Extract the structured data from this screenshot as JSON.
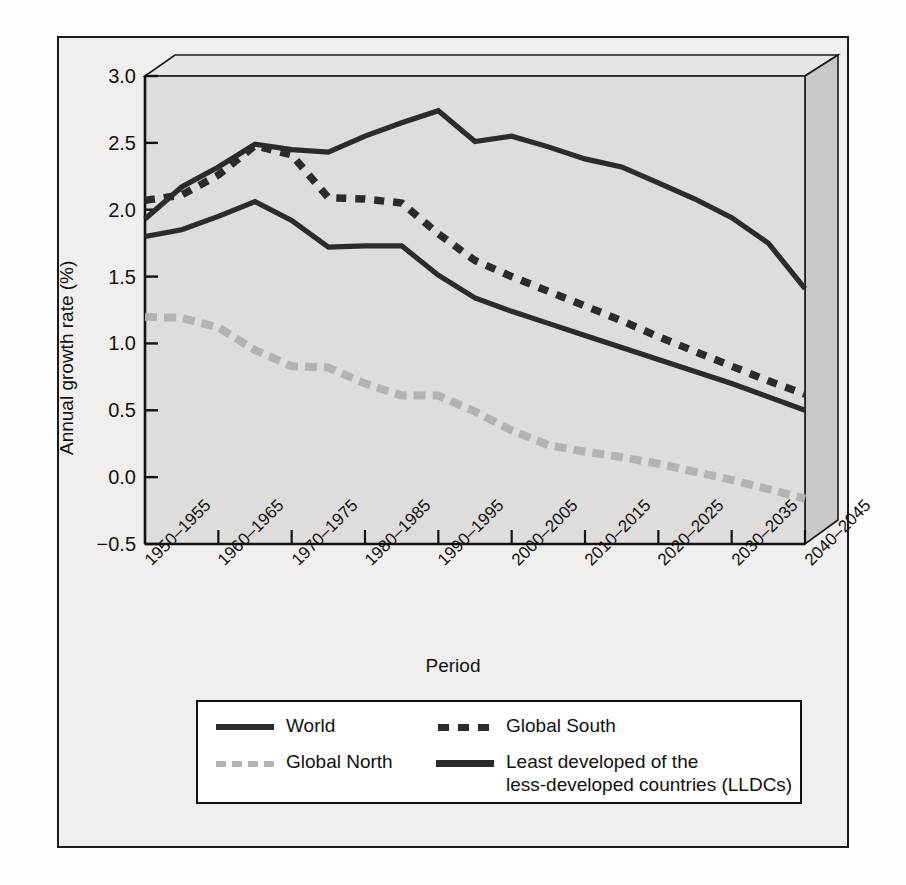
{
  "credit": "United Nations",
  "axes": {
    "ylabel": "Annual growth rate (%)",
    "xlabel": "Period",
    "yticks": [
      "3.0",
      "2.5",
      "2.0",
      "1.5",
      "1.0",
      "0.5",
      "0.0",
      "−0.5"
    ],
    "xticks": [
      "1950–1955",
      "1960–1965",
      "1970–1975",
      "1980–1985",
      "1990–1995",
      "2000–2005",
      "2010–2015",
      "2020–2025",
      "2030–2035",
      "2040–2045"
    ]
  },
  "legend": {
    "items": [
      {
        "label": "World",
        "style": "solid-thick",
        "color": "#2b2b2b"
      },
      {
        "label": "Global South",
        "style": "dashed-dark",
        "color": "#2b2b2b"
      },
      {
        "label": "Global North",
        "style": "dashed-light",
        "color": "#b3b3b3"
      },
      {
        "label_line1": "Least developed of the",
        "label_line2": "less-developed countries (LLDCs)",
        "style": "solid-thick",
        "color": "#2b2b2b"
      }
    ]
  },
  "chart_data": {
    "type": "line",
    "title": "",
    "xlabel": "Period",
    "ylabel": "Annual growth rate (%)",
    "ylim": [
      -0.5,
      3.0
    ],
    "grid": false,
    "legend_position": "below",
    "categories": [
      "1950–1955",
      "1955–1960",
      "1960–1965",
      "1965–1970",
      "1970–1975",
      "1975–1980",
      "1980–1985",
      "1985–1990",
      "1990–1995",
      "1995–2000",
      "2000–2005",
      "2005–2010",
      "2010–2015",
      "2015–2020",
      "2020–2025",
      "2025–2030",
      "2030–2035",
      "2035–2040",
      "2040–2045"
    ],
    "series": [
      {
        "name": "World",
        "style": "solid",
        "color": "#2b2b2b",
        "values": [
          1.8,
          1.85,
          1.95,
          2.06,
          1.92,
          1.72,
          1.73,
          1.73,
          1.51,
          1.34,
          1.24,
          1.15,
          1.06,
          0.97,
          0.88,
          0.79,
          0.7,
          0.6,
          0.5
        ]
      },
      {
        "name": "Global South",
        "style": "dashed",
        "color": "#2b2b2b",
        "values": [
          2.07,
          2.11,
          2.26,
          2.48,
          2.41,
          2.09,
          2.08,
          2.05,
          1.82,
          1.62,
          1.5,
          1.39,
          1.28,
          1.17,
          1.05,
          0.94,
          0.83,
          0.72,
          0.62
        ]
      },
      {
        "name": "Global North",
        "style": "dashed",
        "color": "#b3b3b3",
        "values": [
          1.2,
          1.19,
          1.12,
          0.95,
          0.83,
          0.82,
          0.7,
          0.61,
          0.61,
          0.49,
          0.35,
          0.24,
          0.19,
          0.15,
          0.1,
          0.04,
          -0.02,
          -0.09,
          -0.16
        ]
      },
      {
        "name": "Least developed of the less-developed countries (LLDCs)",
        "style": "solid",
        "color": "#2b2b2b",
        "values": [
          1.93,
          2.17,
          2.32,
          2.49,
          2.45,
          2.43,
          2.55,
          2.65,
          2.74,
          2.51,
          2.55,
          2.47,
          2.38,
          2.32,
          2.2,
          2.08,
          1.94,
          1.75,
          1.41
        ]
      }
    ]
  }
}
